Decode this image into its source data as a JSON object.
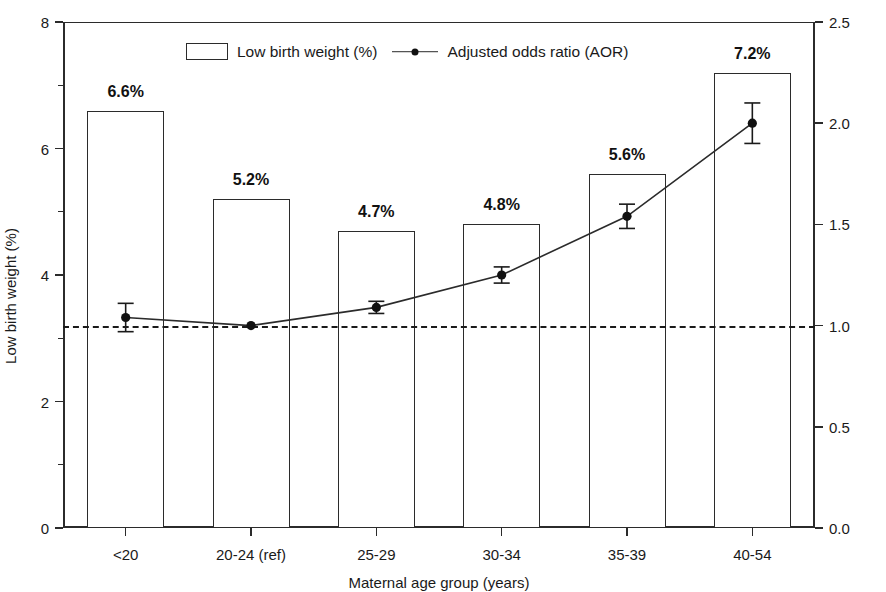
{
  "chart_data": {
    "type": "bar",
    "title": "",
    "xlabel": "Maternal age group (years)",
    "ylabel": "Low birth weight (%)",
    "y2label": "Adjusted odds ratio",
    "categories": [
      "<20",
      "20-24 (ref)",
      "25-29",
      "30-34",
      "35-39",
      "40-54"
    ],
    "ylim": [
      0,
      8
    ],
    "y2lim": [
      0,
      2.5
    ],
    "yticks": [
      "0",
      "2",
      "4",
      "6",
      "8"
    ],
    "ytick_values": [
      0,
      2,
      4,
      6,
      8
    ],
    "y2ticks": [
      "0.0",
      "0.5",
      "1.0",
      "1.5",
      "2.0",
      "2.5"
    ],
    "y2tick_values": [
      0,
      0.5,
      1.0,
      1.5,
      2.0,
      2.5
    ],
    "grid": false,
    "legend_position": "top-center",
    "reference_line": {
      "value": 1.0,
      "axis": "y2",
      "style": "dashed"
    },
    "series": [
      {
        "name": "Low birth weight (%)",
        "type": "bar",
        "axis": "y1",
        "values": [
          6.6,
          5.2,
          4.7,
          4.8,
          5.6,
          7.2
        ],
        "data_labels": [
          "6.6%",
          "5.2%",
          "4.7%",
          "4.8%",
          "5.6%",
          "7.2%"
        ]
      },
      {
        "name": "Adjusted odds ratio (AOR)",
        "type": "line",
        "axis": "y2",
        "values": [
          1.04,
          1.0,
          1.09,
          1.25,
          1.54,
          2.0
        ],
        "error_low": [
          0.97,
          1.0,
          1.06,
          1.21,
          1.48,
          1.9
        ],
        "error_high": [
          1.11,
          1.0,
          1.12,
          1.29,
          1.6,
          2.1
        ]
      }
    ]
  },
  "legend": {
    "bar_label": "Low birth weight (%)",
    "line_label": "Adjusted odds ratio (AOR)"
  }
}
